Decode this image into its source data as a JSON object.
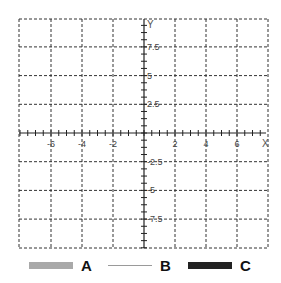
{
  "chart_data": {
    "type": "line",
    "title": "",
    "xlabel": "X",
    "ylabel": "Y",
    "xlim": [
      -8,
      8
    ],
    "ylim": [
      -10,
      10
    ],
    "x_ticks": [
      -6,
      -4,
      -2,
      2,
      4,
      6
    ],
    "x_tick_labels": [
      "-6",
      "-4",
      "-2",
      "2",
      "4",
      "6"
    ],
    "y_ticks": [
      7.5,
      5,
      2.5,
      -2.5,
      -5,
      -7.5
    ],
    "y_tick_labels": [
      "7.5",
      "5",
      "2.5",
      "-2.5",
      "-5",
      "-7.5"
    ],
    "grid": true,
    "grid_style": "dashed",
    "legend_position": "bottom",
    "series": [
      {
        "name": "A",
        "color": "#a9a9a9",
        "style": "band",
        "values": []
      },
      {
        "name": "B",
        "color": "#9a9a9a",
        "style": "thin-line",
        "values": []
      },
      {
        "name": "C",
        "color": "#222222",
        "style": "band",
        "values": []
      }
    ]
  },
  "legend": {
    "items": [
      {
        "label": "A",
        "color": "#a9a9a9"
      },
      {
        "label": "B",
        "color": "#9a9a9a"
      },
      {
        "label": "C",
        "color": "#222222"
      }
    ]
  }
}
